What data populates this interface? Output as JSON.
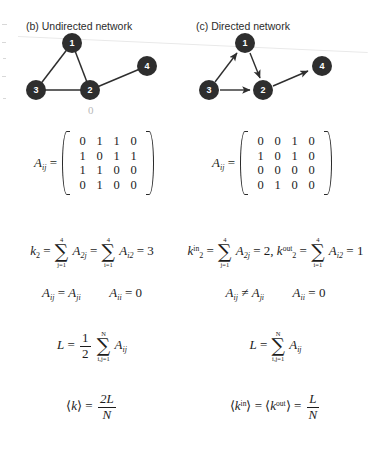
{
  "figure": {
    "panels": [
      {
        "id": "b",
        "caption": "(b) Undirected network",
        "graph": {
          "nodes": [
            {
              "label": "1",
              "x": 54,
              "y": 13,
              "r": 10
            },
            {
              "label": "2",
              "x": 72,
              "y": 60,
              "r": 10
            },
            {
              "label": "3",
              "x": 18,
              "y": 60,
              "r": 10
            },
            {
              "label": "4",
              "x": 129,
              "y": 36,
              "r": 10
            }
          ],
          "edges": [
            {
              "from": "1",
              "to": "3",
              "directed": false
            },
            {
              "from": "1",
              "to": "2",
              "directed": false
            },
            {
              "from": "3",
              "to": "2",
              "directed": false
            },
            {
              "from": "2",
              "to": "4",
              "directed": false
            }
          ]
        },
        "matrix": {
          "label": "A",
          "label_sub": "ij",
          "equals": "=",
          "rows": [
            [
              "0",
              "1",
              "1",
              "0"
            ],
            [
              "1",
              "0",
              "1",
              "1"
            ],
            [
              "1",
              "1",
              "0",
              "0"
            ],
            [
              "0",
              "1",
              "0",
              "0"
            ]
          ]
        },
        "degree": {
          "k_symbol": "k",
          "k_sub": "2",
          "eq1": "=",
          "sum1_upper": "4",
          "sum1_lower": "j=1",
          "term1": "A",
          "term1_sub": "2j",
          "eq2": "=",
          "sum2_upper": "4",
          "sum2_lower": "i=1",
          "term2": "A",
          "term2_sub": "i2",
          "eq3": "=",
          "value": "3"
        },
        "symmetry": {
          "left": "A",
          "left_sub": "ij",
          "relation": "=",
          "right": "A",
          "right_sub": "ji",
          "self_left": "A",
          "self_sub": "ii",
          "self_eq": "=",
          "self_value": "0"
        },
        "links": {
          "L": "L",
          "equals": "=",
          "coef_num": "1",
          "coef_den": "2",
          "sum_upper": "N",
          "sum_lower": "i,j=1",
          "term": "A",
          "term_sub": "ij"
        },
        "average": {
          "bracket_open": "⟨",
          "k_symbol": "k",
          "k_sup": "",
          "bracket_close": "⟩",
          "equals": "=",
          "num": "2L",
          "den": "N"
        }
      },
      {
        "id": "c",
        "caption": "(c) Directed network",
        "graph": {
          "nodes": [
            {
              "label": "1",
              "x": 53,
              "y": 13,
              "r": 10
            },
            {
              "label": "2",
              "x": 71,
              "y": 60,
              "r": 10
            },
            {
              "label": "3",
              "x": 17,
              "y": 60,
              "r": 10
            },
            {
              "label": "4",
              "x": 130,
              "y": 36,
              "r": 10
            }
          ],
          "edges": [
            {
              "from": "3",
              "to": "1",
              "directed": true
            },
            {
              "from": "1",
              "to": "2",
              "directed": true
            },
            {
              "from": "3",
              "to": "2",
              "directed": true
            },
            {
              "from": "2",
              "to": "4",
              "directed": true
            }
          ]
        },
        "matrix": {
          "label": "A",
          "label_sub": "ij",
          "equals": "=",
          "rows": [
            [
              "0",
              "0",
              "1",
              "0"
            ],
            [
              "1",
              "0",
              "1",
              "0"
            ],
            [
              "0",
              "0",
              "0",
              "0"
            ],
            [
              "0",
              "1",
              "0",
              "0"
            ]
          ]
        },
        "degree": {
          "kin_symbol": "k",
          "kin_sub": "2",
          "kin_sup": "in",
          "eq1": "=",
          "sum1_upper": "4",
          "sum1_lower": "j=1",
          "term1": "A",
          "term1_sub": "2j",
          "eq2": "=",
          "value_in": "2,",
          "kout_symbol": "k",
          "kout_sub": "2",
          "kout_sup": "out",
          "eq3": "=",
          "sum2_upper": "4",
          "sum2_lower": "i=1",
          "term2": "A",
          "term2_sub": "i2",
          "eq4": "=",
          "value_out": "1"
        },
        "symmetry": {
          "left": "A",
          "left_sub": "ij",
          "relation": "≠",
          "right": "A",
          "right_sub": "ji",
          "self_left": "A",
          "self_sub": "ii",
          "self_eq": "=",
          "self_value": "0"
        },
        "links": {
          "L": "L",
          "equals": "=",
          "sum_upper": "N",
          "sum_lower": "i,j=1",
          "term": "A",
          "term_sub": "ij"
        },
        "average": {
          "bracket_open": "⟨",
          "kin_symbol": "k",
          "kin_sup": "in",
          "bracket_close1": "⟩",
          "eq1": "=",
          "bracket_open2": "⟨",
          "kout_symbol": "k",
          "kout_sup": "out",
          "bracket_close2": "⟩",
          "eq2": "=",
          "num": "L",
          "den": "N"
        }
      }
    ],
    "artifacts": {
      "stray_digit": "0"
    }
  }
}
